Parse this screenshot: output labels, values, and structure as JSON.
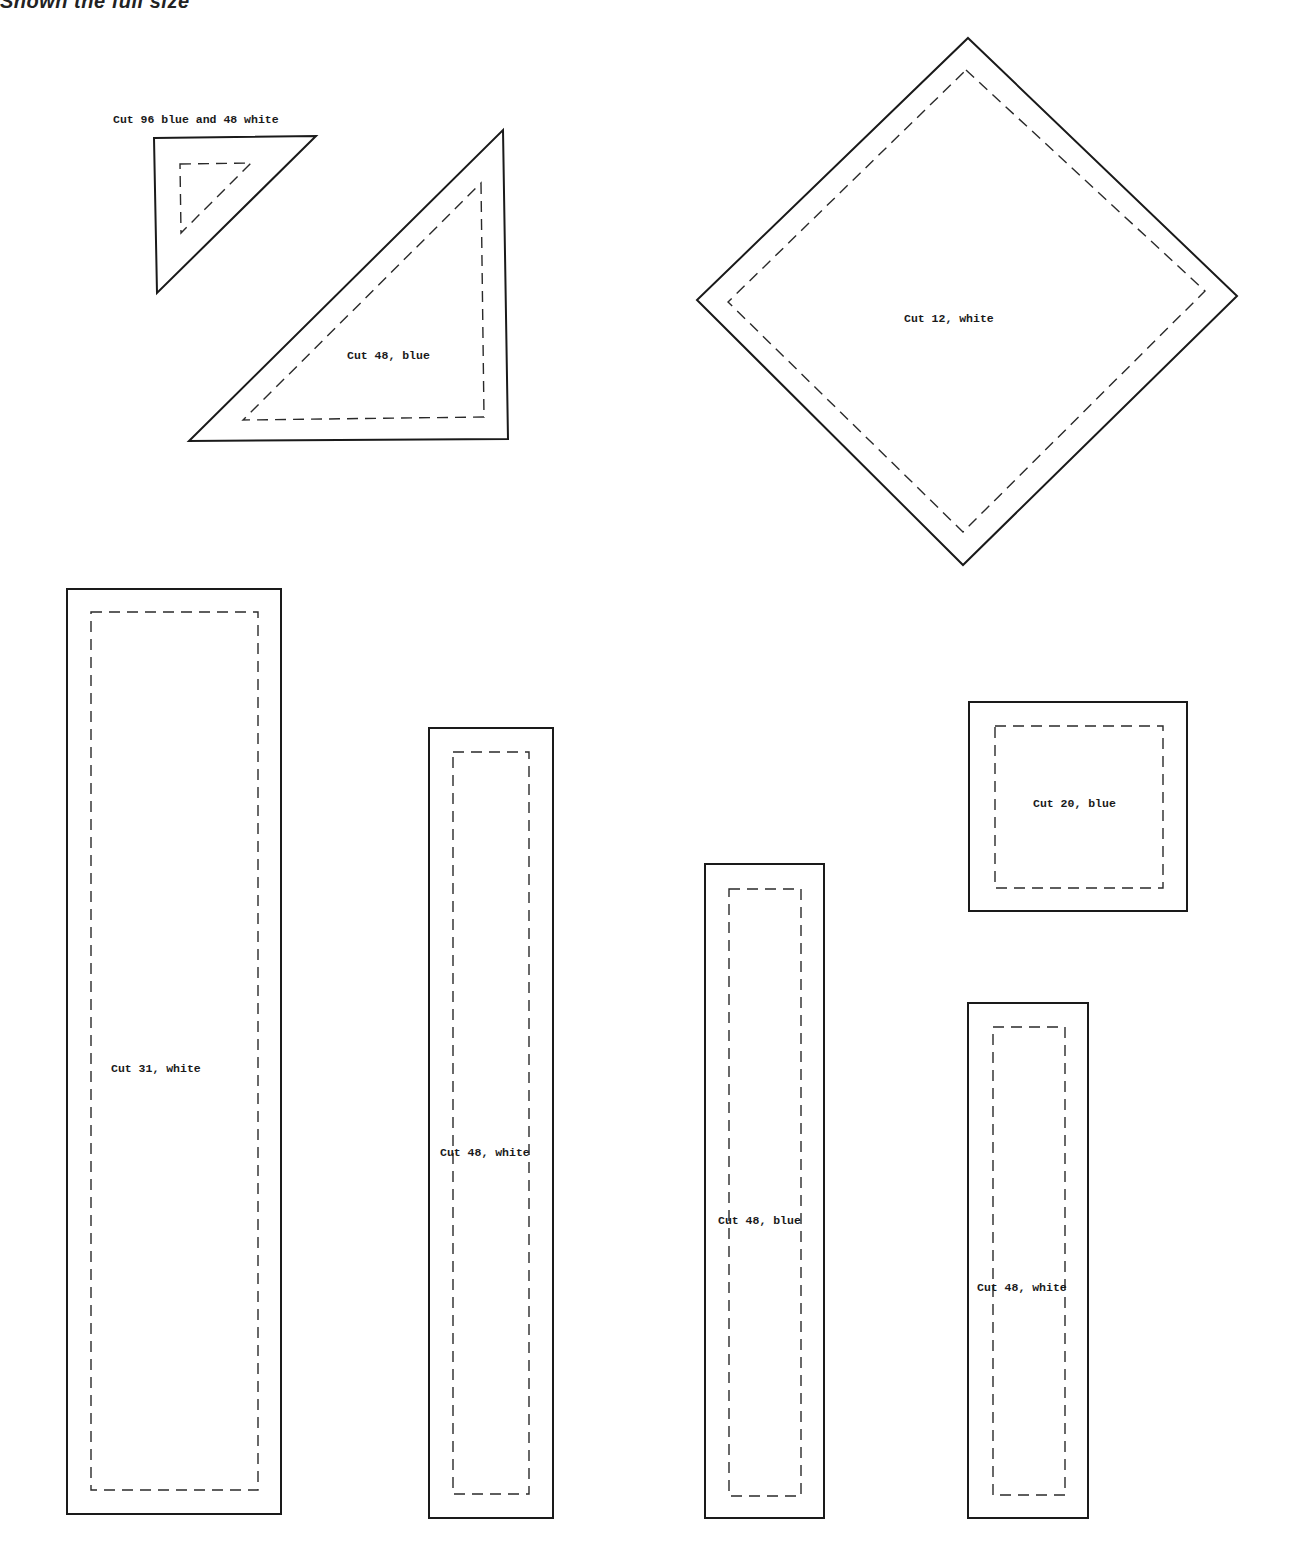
{
  "header": {
    "title_visible": "Shown the full size",
    "title_faded": "."
  },
  "pieces": [
    {
      "id": "small-triangle",
      "shape": "triangle",
      "label": "Cut 96 blue and 48 white"
    },
    {
      "id": "large-triangle",
      "shape": "triangle",
      "label": "Cut 48, blue"
    },
    {
      "id": "diamond-square",
      "shape": "square-on-point",
      "label": "Cut 12, white"
    },
    {
      "id": "long-strip",
      "shape": "rectangle",
      "label": "Cut 31, white"
    },
    {
      "id": "strip-white-a",
      "shape": "rectangle",
      "label": "Cut 48, white"
    },
    {
      "id": "strip-blue",
      "shape": "rectangle",
      "label": "Cut 48, blue"
    },
    {
      "id": "small-square",
      "shape": "square",
      "label": "Cut 20, blue"
    },
    {
      "id": "strip-white-b",
      "shape": "rectangle",
      "label": "Cut 48, white"
    }
  ],
  "legend": {
    "solid_line": "cutting line",
    "dashed_line": "seam line"
  }
}
